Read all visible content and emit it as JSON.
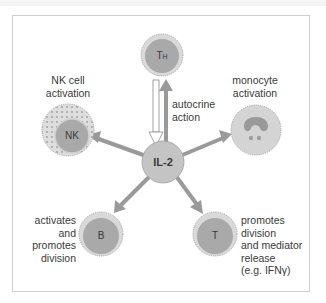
{
  "center": {
    "label": "IL-2"
  },
  "cells": {
    "th": {
      "label": "TH",
      "label_main": "T",
      "label_sub": "H"
    },
    "nk": {
      "label": "NK"
    },
    "monocyte": {
      "label": ""
    },
    "b": {
      "label": "B"
    },
    "t": {
      "label": "T"
    }
  },
  "annotations": {
    "autocrine": [
      "autocrine",
      "action"
    ],
    "nk": [
      "NK cell",
      "activation"
    ],
    "monocyte": [
      "monocyte",
      "activation"
    ],
    "b": [
      "activates",
      "and",
      "promotes",
      "division"
    ],
    "t": [
      "promotes",
      "division",
      "and mediator",
      "release",
      "(e.g. IFNγ)"
    ]
  },
  "colors": {
    "cell_fill": "#a9a9a9",
    "cell_outer": "#d9d9d9",
    "il2_fill": "#c4c4c4",
    "arrow": "#9a9a9a",
    "frame": "#cfcfcf",
    "text": "#3a3a3a"
  }
}
